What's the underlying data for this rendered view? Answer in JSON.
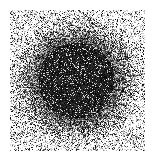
{
  "image": {
    "description": "Stippled / noise-dithered radial gradient disc",
    "width": 152,
    "height": 160,
    "background": "#ffffff",
    "ink": "#000000",
    "noise_region": {
      "x0": 10,
      "y0": 10,
      "x1": 145,
      "y1": 151
    },
    "disc": {
      "cx": 76,
      "cy": 80,
      "core_radius": 38,
      "outer_radius": 66
    },
    "density": {
      "core": 0.88,
      "edge": 0.12,
      "base_noise": 0.18
    },
    "seed": 1337
  }
}
